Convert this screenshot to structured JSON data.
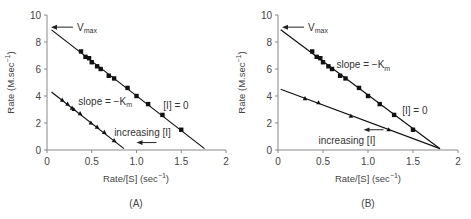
{
  "chart_data": [
    {
      "type": "scatter",
      "panel_label": "(A)",
      "title": "",
      "xlabel": "Rate/[S] (sec⁻¹)",
      "ylabel": "Rate (M.sec⁻¹)",
      "xlim": [
        0,
        2
      ],
      "ylim": [
        0,
        10
      ],
      "xticks": [
        "0",
        "0.5",
        "1.0",
        "1.5",
        "2"
      ],
      "yticks": [
        "0",
        "2",
        "4",
        "6",
        "8",
        "10"
      ],
      "grid": false,
      "series": [
        {
          "name": "[I] = 0",
          "marker": "square",
          "fit_line": {
            "x": [
              0.05,
              1.76
            ],
            "y": [
              8.9,
              0.1
            ]
          },
          "points": [
            [
              0.38,
              7.3
            ],
            [
              0.43,
              6.9
            ],
            [
              0.47,
              6.8
            ],
            [
              0.5,
              6.5
            ],
            [
              0.56,
              6.2
            ],
            [
              0.6,
              6.0
            ],
            [
              0.69,
              5.5
            ],
            [
              0.75,
              5.3
            ],
            [
              0.9,
              4.6
            ],
            [
              1.0,
              4.0
            ],
            [
              1.13,
              3.4
            ],
            [
              1.29,
              2.6
            ],
            [
              1.5,
              1.5
            ]
          ]
        },
        {
          "name": "increasing [I]",
          "marker": "triangle",
          "fit_line": {
            "x": [
              0.05,
              0.86
            ],
            "y": [
              4.3,
              0.1
            ]
          },
          "points": [
            [
              0.17,
              3.7
            ],
            [
              0.23,
              3.4
            ],
            [
              0.28,
              3.1
            ],
            [
              0.3,
              3.0
            ],
            [
              0.37,
              2.7
            ],
            [
              0.49,
              2.0
            ],
            [
              0.56,
              1.7
            ],
            [
              0.64,
              1.3
            ],
            [
              0.75,
              0.7
            ]
          ]
        }
      ],
      "annotations": [
        {
          "text_main": "V",
          "text_sub": "max",
          "arrow": "left",
          "x": 0.3,
          "y": 9.1
        },
        {
          "text_main": "slope = −K",
          "text_sub": "m",
          "x": 0.35,
          "y": 3.6
        },
        {
          "text": "[I] = 0",
          "x": 1.3,
          "y": 3.3
        },
        {
          "text": "increasing [I]",
          "x": 0.75,
          "y": 1.3,
          "arrow": "left"
        }
      ]
    },
    {
      "type": "scatter",
      "panel_label": "(B)",
      "title": "",
      "xlabel": "Rate/[S] (sec⁻¹)",
      "ylabel": "Rate (M.sec⁻¹)",
      "xlim": [
        0,
        2
      ],
      "ylim": [
        0,
        10
      ],
      "xticks": [
        "0",
        "0.5",
        "1.0",
        "1.5",
        "2"
      ],
      "yticks": [
        "0",
        "2",
        "4",
        "6",
        "8",
        "10"
      ],
      "grid": false,
      "series": [
        {
          "name": "[I] = 0",
          "marker": "square",
          "fit_line": {
            "x": [
              0.03,
              1.8
            ],
            "y": [
              8.9,
              0.1
            ]
          },
          "points": [
            [
              0.38,
              7.3
            ],
            [
              0.43,
              6.9
            ],
            [
              0.47,
              6.8
            ],
            [
              0.5,
              6.5
            ],
            [
              0.56,
              6.2
            ],
            [
              0.6,
              6.0
            ],
            [
              0.69,
              5.5
            ],
            [
              0.75,
              5.3
            ],
            [
              0.9,
              4.6
            ],
            [
              1.0,
              4.0
            ],
            [
              1.13,
              3.4
            ],
            [
              1.29,
              2.6
            ],
            [
              1.5,
              1.5
            ]
          ]
        },
        {
          "name": "increasing [I]",
          "marker": "triangle",
          "fit_line": {
            "x": [
              0.03,
              1.8
            ],
            "y": [
              4.5,
              0.1
            ]
          },
          "points": [
            [
              0.3,
              3.8
            ],
            [
              0.45,
              3.5
            ],
            [
              0.81,
              2.5
            ],
            [
              1.23,
              1.5
            ]
          ]
        }
      ],
      "annotations": [
        {
          "text_main": "V",
          "text_sub": "max",
          "arrow": "left",
          "x": 0.3,
          "y": 9.1
        },
        {
          "text_main": "slope = −K",
          "text_sub": "m",
          "x": 0.65,
          "y": 6.3
        },
        {
          "text": "[I] = 0",
          "x": 1.38,
          "y": 2.9
        },
        {
          "text": "increasing [I]",
          "x": 0.45,
          "y": 0.7,
          "arrow": "left"
        }
      ]
    }
  ]
}
